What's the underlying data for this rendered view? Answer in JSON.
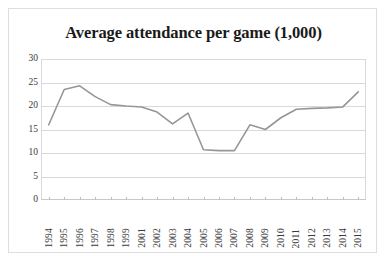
{
  "chart_data": {
    "type": "line",
    "title": "Average attendance per game (1,000)",
    "xlabel": "",
    "ylabel": "",
    "ylim": [
      0,
      30
    ],
    "yticks": [
      0,
      5,
      10,
      15,
      20,
      25,
      30
    ],
    "grid": true,
    "legend": "none",
    "line_color": "#969696",
    "gridline_color": "#d9d9d9",
    "background_color": "#ffffff",
    "border_color": "#dedede",
    "categories": [
      "1994",
      "1995",
      "1996",
      "1997",
      "1998",
      "1999",
      "2001",
      "2002",
      "2003",
      "2004",
      "2005",
      "2006",
      "2007",
      "2008",
      "2009",
      "2010",
      "2011",
      "2012",
      "2013",
      "2014",
      "2015"
    ],
    "values": [
      16.0,
      23.5,
      24.3,
      22.0,
      20.3,
      20.0,
      19.8,
      18.7,
      16.2,
      18.5,
      10.7,
      10.5,
      10.5,
      16.0,
      15.0,
      17.5,
      19.3,
      19.5,
      19.6,
      19.8,
      23.0
    ],
    "series": [
      {
        "name": "Average attendance per game",
        "values": [
          16.0,
          23.5,
          24.3,
          22.0,
          20.3,
          20.0,
          19.8,
          18.7,
          16.2,
          18.5,
          10.7,
          10.5,
          10.5,
          16.0,
          15.0,
          17.5,
          19.3,
          19.5,
          19.6,
          19.8,
          23.0
        ]
      }
    ]
  }
}
